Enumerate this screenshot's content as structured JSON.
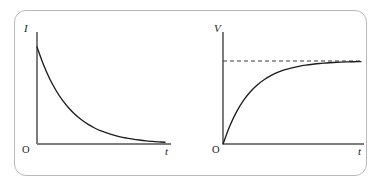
{
  "figure": {
    "name": "rc-circuit-transient-graphs",
    "frame": {
      "border_color": "#b9b9b9",
      "background": "#ffffff",
      "corner_radius": "12px"
    },
    "curve_color": "#1d1d1d",
    "axis_color": "#7d7d7d",
    "asymptote_color": "#3a3a3a"
  },
  "panels": [
    {
      "id": "current-decay",
      "y_axis_label": "I",
      "x_axis_label": "t",
      "origin_label": "O",
      "has_asymptote": false
    },
    {
      "id": "voltage-rise",
      "y_axis_label": "V",
      "x_axis_label": "t",
      "origin_label": "O",
      "has_asymptote": true
    }
  ],
  "chart_data": [
    {
      "type": "line",
      "id": "current-decay",
      "title": "",
      "xlabel": "t",
      "ylabel": "I",
      "grid": false,
      "legend": null,
      "annotations": [
        "O"
      ],
      "xlim": [
        0,
        1
      ],
      "ylim": [
        0,
        1
      ],
      "series": [
        {
          "name": "I(t) = I0 * exp(-t/RC)",
          "x": [
            0.0,
            0.05,
            0.1,
            0.15,
            0.2,
            0.25,
            0.3,
            0.35,
            0.4,
            0.45,
            0.5,
            0.55,
            0.6,
            0.65,
            0.7,
            0.75,
            0.8,
            0.85,
            0.9,
            0.95,
            1.0
          ],
          "y": [
            1.0,
            0.819,
            0.67,
            0.549,
            0.449,
            0.368,
            0.301,
            0.247,
            0.202,
            0.165,
            0.135,
            0.111,
            0.091,
            0.074,
            0.061,
            0.05,
            0.041,
            0.033,
            0.027,
            0.022,
            0.018
          ]
        }
      ]
    },
    {
      "type": "line",
      "id": "voltage-rise",
      "title": "",
      "xlabel": "t",
      "ylabel": "V",
      "grid": false,
      "legend": null,
      "annotations": [
        "O",
        "asymptote V = V0"
      ],
      "xlim": [
        0,
        1
      ],
      "ylim": [
        0,
        1
      ],
      "asymptote_y": 1.0,
      "series": [
        {
          "name": "V(t) = V0 * (1 - exp(-t/RC))",
          "x": [
            0.0,
            0.05,
            0.1,
            0.15,
            0.2,
            0.25,
            0.3,
            0.35,
            0.4,
            0.45,
            0.5,
            0.55,
            0.6,
            0.65,
            0.7,
            0.75,
            0.8,
            0.85,
            0.9,
            0.95,
            1.0
          ],
          "y": [
            0.0,
            0.221,
            0.393,
            0.528,
            0.632,
            0.713,
            0.777,
            0.826,
            0.865,
            0.895,
            0.918,
            0.936,
            0.95,
            0.961,
            0.97,
            0.976,
            0.982,
            0.986,
            0.989,
            0.991,
            0.993
          ]
        }
      ]
    }
  ]
}
